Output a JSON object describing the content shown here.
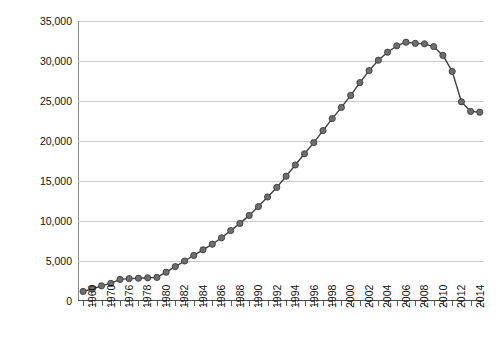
{
  "chart_data": {
    "type": "line",
    "title": "",
    "xlabel": "",
    "ylabel": "Subscriptions in Thousands",
    "ylim": [
      0,
      35000
    ],
    "ytick_labels": [
      "35,000",
      "30,000",
      "25,000",
      "20,000",
      "15,000",
      "10,000",
      "5,000",
      "0"
    ],
    "ytick_values": [
      35000,
      30000,
      25000,
      20000,
      15000,
      10000,
      5000,
      0
    ],
    "grid": true,
    "legend": "none",
    "marker": "filled-circle",
    "series_color": "#6e6e6e",
    "line_color": "#3d3d3d",
    "grid_color": "#c9c9c9",
    "xtick_labels": [
      "1960",
      "1970",
      "1976",
      "1978",
      "1980",
      "1982",
      "1984",
      "1986",
      "1988",
      "1990",
      "1992",
      "1994",
      "1996",
      "1998",
      "2000",
      "2002",
      "2004",
      "2006",
      "2008",
      "2010",
      "2012",
      "2014"
    ],
    "categories": [
      "1960",
      "1965",
      "1970",
      "1973",
      "1976",
      "1977",
      "1978",
      "1979",
      "1980",
      "1981",
      "1982",
      "1983",
      "1984",
      "1985",
      "1986",
      "1987",
      "1988",
      "1989",
      "1990",
      "1991",
      "1992",
      "1993",
      "1994",
      "1995",
      "1996",
      "1997",
      "1998",
      "1999",
      "2000",
      "2001",
      "2002",
      "2003",
      "2004",
      "2005",
      "2006",
      "2007",
      "2008",
      "2009",
      "2010",
      "2011",
      "2012",
      "2013",
      "2014",
      "2015"
    ],
    "values": [
      1200,
      1500,
      1900,
      2200,
      2700,
      2800,
      2850,
      2900,
      2950,
      3600,
      4300,
      5000,
      5700,
      6400,
      7100,
      7900,
      8800,
      9700,
      10700,
      11800,
      13000,
      14200,
      15600,
      17000,
      18400,
      19800,
      21300,
      22800,
      24200,
      25700,
      27300,
      28800,
      30100,
      31100,
      31900,
      32350,
      32200,
      32150,
      31800,
      30700,
      28700,
      24900,
      23700,
      23600
    ]
  },
  "axis": {
    "y_title": "Subscriptions in Thousands"
  }
}
